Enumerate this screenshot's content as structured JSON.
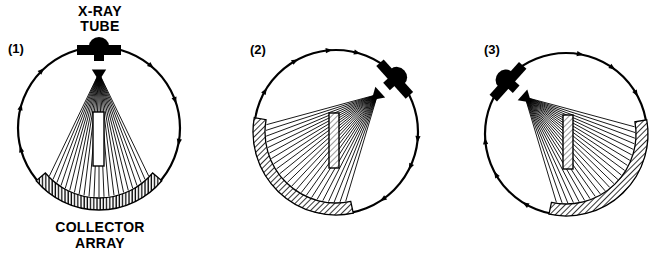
{
  "figure": {
    "width": 668,
    "height": 264,
    "ink_color": "#000000",
    "background": "#ffffff"
  },
  "labels": {
    "tube_line1": "X-RAY",
    "tube_line2": "TUBE",
    "collector_line1": "COLLECTOR",
    "collector_line2": "ARRAY"
  },
  "panels": [
    {
      "id": "panel-1",
      "number": "(1)",
      "number_pos": [
        8,
        42
      ],
      "center": [
        99,
        128
      ],
      "radius": 81,
      "tube_angle_deg": 0,
      "collector_start_deg": 130,
      "collector_end_deg": 230,
      "collector_hatch": "vertical",
      "phantom": {
        "x": 93,
        "y": 112,
        "w": 11,
        "h": 54,
        "hatched": false
      },
      "arrow_angles_deg": [
        40,
        70,
        100,
        255,
        285,
        315
      ],
      "ray_count": 23
    },
    {
      "id": "panel-2",
      "number": "(2)",
      "number_pos": [
        250,
        43
      ],
      "center": [
        336,
        132
      ],
      "radius": 82,
      "tube_angle_deg": 48,
      "collector_start_deg": 168,
      "collector_end_deg": 280,
      "collector_hatch": "diagonal",
      "phantom": {
        "x": 329,
        "y": 113,
        "w": 10,
        "h": 55,
        "hatched": true
      },
      "arrow_angles_deg": [
        -5,
        15,
        95,
        115,
        145,
        300,
        330
      ],
      "ray_count": 23
    },
    {
      "id": "panel-3",
      "number": "(3)",
      "number_pos": [
        484,
        43
      ],
      "center": [
        566,
        134
      ],
      "radius": 81,
      "tube_angle_deg": -48,
      "collector_start_deg": 80,
      "collector_end_deg": 192,
      "collector_hatch": "diagonal",
      "phantom": {
        "x": 563,
        "y": 115,
        "w": 10,
        "h": 54,
        "hatched": true
      },
      "arrow_angles_deg": [
        10,
        35,
        60,
        210,
        240,
        265
      ],
      "ray_count": 23
    }
  ]
}
